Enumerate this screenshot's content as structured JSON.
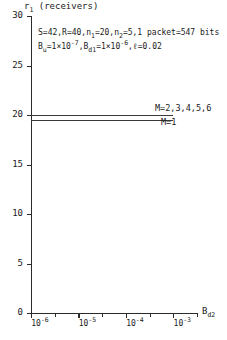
{
  "chart_data": {
    "type": "line",
    "title": "",
    "ylabel": "r1 (receivers)",
    "ylabel_base": "r",
    "ylabel_sub": "1",
    "ylabel_rest": " (receivers)",
    "xlabel": "Bd2",
    "xlabel_base": "B",
    "xlabel_sub": "d2",
    "xscale": "log",
    "xlim": [
      1e-06,
      0.00316
    ],
    "ylim": [
      0,
      30
    ],
    "grid": false,
    "legend_position": "inside-right",
    "yticks": [
      30,
      25,
      20,
      15,
      10,
      5,
      0
    ],
    "ytick_labels": [
      "30",
      "25",
      "20",
      "15",
      "10",
      "5",
      "0"
    ],
    "xticks": [
      1e-06,
      1e-05,
      0.0001,
      0.001
    ],
    "xtick_labels": [
      {
        "mantissa": "10",
        "exponent": "-6"
      },
      {
        "mantissa": "10",
        "exponent": "-5"
      },
      {
        "mantissa": "10",
        "exponent": "-4"
      },
      {
        "mantissa": "10",
        "exponent": "-3"
      }
    ],
    "xtick_minor_count": 8,
    "series": [
      {
        "name": "M=2,3,4,5,6",
        "label": "M=2,3,4,5,6",
        "x": [
          1e-06,
          0.001
        ],
        "values": [
          20.0,
          20.0
        ],
        "y_constant": 20.0
      },
      {
        "name": "M=1",
        "label": "M=1",
        "x": [
          1e-06,
          0.001
        ],
        "values": [
          19.5,
          19.5
        ],
        "y_constant": 19.5
      }
    ],
    "annotations": [
      {
        "id": "params-line-1",
        "text": "S=42,R=40,n1=20,n2=5,1 packet=547 bits",
        "segments": [
          {
            "t": "S=42,R=40,n"
          },
          {
            "t": "1",
            "style": "sub"
          },
          {
            "t": "=20,n"
          },
          {
            "t": "2",
            "style": "sub"
          },
          {
            "t": "=5,1 packet=547 bits"
          }
        ]
      },
      {
        "id": "params-line-2",
        "text": "Bu=1x10^-7,Bd1=1x10^-6,l=0.02",
        "segments": [
          {
            "t": "B"
          },
          {
            "t": "u",
            "style": "sub"
          },
          {
            "t": "=1×10"
          },
          {
            "t": "-7",
            "style": "sup"
          },
          {
            "t": ",B"
          },
          {
            "t": "d1",
            "style": "sub"
          },
          {
            "t": "=1×10"
          },
          {
            "t": "-6",
            "style": "sup"
          },
          {
            "t": ",ℓ=0.02"
          }
        ]
      }
    ]
  },
  "colors": {
    "axis": "#2b2b2b",
    "curve": "#3a3a3a",
    "text": "#1a1a1a",
    "background": "#ffffff"
  }
}
